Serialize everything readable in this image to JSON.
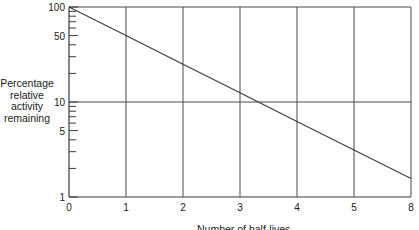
{
  "chart_data": {
    "type": "line",
    "title": "",
    "xlabel": "Number of half-lives",
    "ylabel_lines": [
      "Percentage",
      "relative",
      "activity",
      "remaining"
    ],
    "x_scale": "linear",
    "y_scale": "log",
    "xlim": [
      0,
      6
    ],
    "ylim": [
      1,
      100
    ],
    "x_ticks": [
      {
        "value": 0,
        "label": "0"
      },
      {
        "value": 1,
        "label": "1"
      },
      {
        "value": 2,
        "label": "2"
      },
      {
        "value": 3,
        "label": "3"
      },
      {
        "value": 4,
        "label": "4"
      },
      {
        "value": 5,
        "label": "5"
      },
      {
        "value": 6,
        "label": "8"
      }
    ],
    "y_major_ticks": [
      {
        "value": 1,
        "label": "1"
      },
      {
        "value": 5,
        "label": "5"
      },
      {
        "value": 10,
        "label": "10"
      },
      {
        "value": 50,
        "label": "50"
      },
      {
        "value": 100,
        "label": "100"
      }
    ],
    "y_minor_ticks": [
      2,
      3,
      4,
      6,
      7,
      8,
      9,
      20,
      30,
      40,
      60,
      70,
      80,
      90
    ],
    "vertical_gridlines": [
      1,
      2,
      3,
      4,
      5,
      6
    ],
    "horizontal_gridlines": [
      10,
      100
    ],
    "grid": true,
    "legend": "none",
    "series": [
      {
        "name": "Relative activity remaining",
        "x": [
          0,
          1,
          2,
          3,
          4,
          5,
          6
        ],
        "y": [
          100,
          50,
          25,
          12.5,
          6.25,
          3.125,
          1.5625
        ]
      }
    ],
    "colors": {
      "line": "#3a3a3a",
      "grid": "#4a4a4a",
      "axis": "#3a3a3a"
    }
  }
}
